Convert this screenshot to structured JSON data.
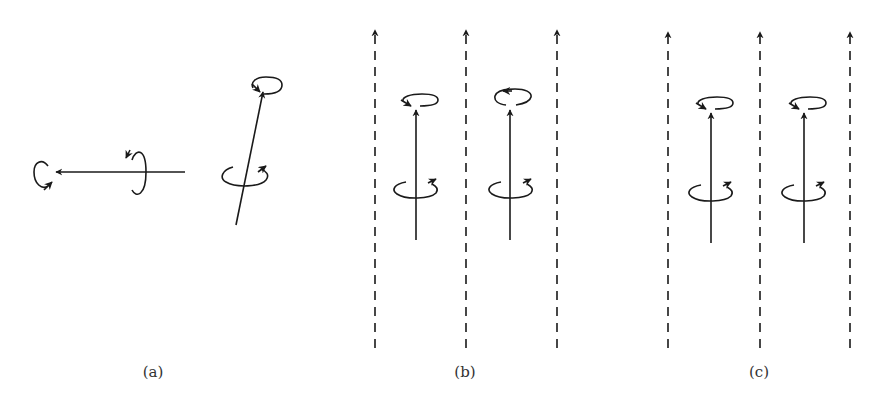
{
  "figure": {
    "stroke_color": "#1a1a1a",
    "background": "#ffffff",
    "panels": [
      {
        "id": "a",
        "label": "(a)",
        "label_pos": [
          153,
          366
        ],
        "description": "Isolated spins with random orientations",
        "arrows": [
          {
            "name": "horizontal-spin-arrow",
            "from": [
              185,
              172
            ],
            "to": [
              56,
              172
            ],
            "loops": [
              {
                "name": "tip-loop",
                "cx": 44,
                "cy": 174,
                "rx": 9,
                "ry": 12,
                "orientation": "vertical",
                "arrow": "lower-right"
              },
              {
                "name": "body-loop",
                "cx": 140,
                "cy": 174,
                "rx": 6,
                "ry": 24,
                "orientation": "vertical",
                "arrow": "upper-left"
              }
            ]
          },
          {
            "name": "tilted-spin-arrow",
            "from": [
              236,
              225
            ],
            "to": [
              263,
              92
            ],
            "loops": [
              {
                "name": "tip-loop",
                "cx": 265,
                "cy": 86,
                "rx": 14,
                "ry": 8,
                "orientation": "horizontal",
                "arrow": "left"
              },
              {
                "name": "body-loop",
                "cx": 244,
                "cy": 175,
                "rx": 23,
                "ry": 9,
                "orientation": "horizontal",
                "arrow": "upper-right"
              }
            ]
          }
        ]
      },
      {
        "id": "b",
        "label": "(b)",
        "label_pos": [
          465,
          366
        ],
        "description": "Spins aligned with field, one precession reversed",
        "field_lines_x": [
          375,
          466,
          557
        ],
        "field_line_y": [
          30,
          348
        ],
        "spins": [
          {
            "x": 416,
            "y_bottom": 240,
            "y_tip": 108,
            "top_loop_cx": 425,
            "top_loop_cy": 102,
            "top_loop_arrow": "lower-left",
            "bottom_loop_cy": 189
          },
          {
            "x": 510,
            "y_bottom": 240,
            "y_tip": 108,
            "top_loop_cx": 515,
            "top_loop_cy": 96,
            "top_loop_arrow": "upper-left",
            "bottom_loop_cy": 189
          }
        ]
      },
      {
        "id": "c",
        "label": "(c)",
        "label_pos": [
          759,
          366
        ],
        "description": "Spins aligned with field, same precession",
        "field_lines_x": [
          668,
          760,
          850
        ],
        "field_line_y": [
          30,
          348
        ],
        "spins": [
          {
            "x": 711,
            "y_bottom": 243,
            "y_tip": 112,
            "top_loop_cx": 720,
            "top_loop_cy": 104,
            "top_loop_arrow": "lower-left",
            "bottom_loop_cy": 192
          },
          {
            "x": 804,
            "y_bottom": 243,
            "y_tip": 112,
            "top_loop_cx": 813,
            "top_loop_cy": 104,
            "top_loop_arrow": "lower-left",
            "bottom_loop_cy": 192
          }
        ]
      }
    ]
  }
}
